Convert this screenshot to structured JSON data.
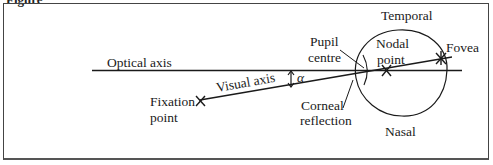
{
  "figure": {
    "cut_label": "Figure",
    "labels": {
      "optical_axis": "Optical axis",
      "visual_axis": "Visual axis",
      "alpha": "α",
      "fixation_line1": "Fixation",
      "fixation_line2": "point",
      "pupil_line1": "Pupil",
      "pupil_line2": "centre",
      "nodal_line1": "Nodal",
      "nodal_line2": "point",
      "corneal_line1": "Corneal",
      "corneal_line2": "reflection",
      "fovea": "Fovea",
      "temporal": "Temporal",
      "nasal": "Nasal"
    },
    "colors": {
      "line": "#1a1a1a",
      "frame": "#444444",
      "background": "#ffffff"
    }
  }
}
